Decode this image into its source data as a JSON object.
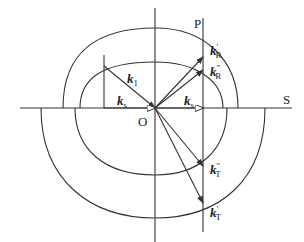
{
  "diagram": {
    "type": "wave-vector-construction",
    "origin_label": "O",
    "axis_labels": {
      "horizontal": "S",
      "interface": "P"
    },
    "vectors": [
      {
        "id": "k1",
        "base": "k",
        "sub": "1",
        "prime": ""
      },
      {
        "id": "ks_left",
        "base": "k",
        "sub": "s",
        "prime": ""
      },
      {
        "id": "ks_right",
        "base": "k",
        "sub": "s",
        "prime": ""
      },
      {
        "id": "kR1",
        "base": "k",
        "sub": "R",
        "prime": "′"
      },
      {
        "id": "kR2",
        "base": "k",
        "sub": "R",
        "prime": "″"
      },
      {
        "id": "kT2",
        "base": "k",
        "sub": "T",
        "prime": "″"
      },
      {
        "id": "kT1",
        "base": "k",
        "sub": "T",
        "prime": "′"
      }
    ],
    "colors": {
      "line": "#333333",
      "text": "#222222",
      "background": "#ffffff"
    }
  }
}
